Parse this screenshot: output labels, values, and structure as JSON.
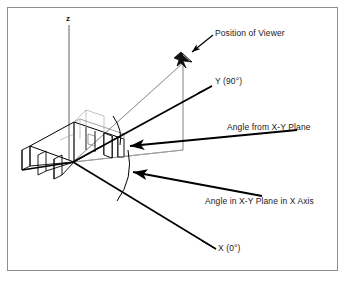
{
  "figure": {
    "type": "technical-line-diagram",
    "title_internal": "3D viewing angle / position of viewer diagram",
    "background_color": "#ffffff",
    "border_color": "#8f8f8f",
    "line_color": "#000000",
    "thin_line_color": "#8a8a8a",
    "axes": [
      {
        "name": "z-axis",
        "label": "z",
        "direction": "vertical-up"
      },
      {
        "name": "y-axis",
        "label": "Y (90°)",
        "direction": "upper-right"
      },
      {
        "name": "x-axis",
        "label": "X (0°)",
        "direction": "lower-right"
      }
    ],
    "labels": {
      "z_axis": "z",
      "position_of_viewer": "Position of Viewer",
      "y_axis": "Y (90°)",
      "angle_from_plane": "Angle from X-Y Plane",
      "angle_in_plane": "Angle in X-Y Plane in X Axis",
      "x_axis": "X (0°)"
    },
    "annotations": [
      {
        "name": "position-of-viewer",
        "text": "Position of Viewer",
        "points_to": "viewer-glyph"
      },
      {
        "name": "y-axis-label",
        "text": "Y (90°)",
        "points_to": "y-axis-line"
      },
      {
        "name": "angle-from-xy-plane",
        "text": "Angle from X-Y Plane",
        "points_to": "elevation-angle-arc"
      },
      {
        "name": "angle-in-xy-plane",
        "text": "Angle in X-Y Plane in X Axis",
        "points_to": "azimuth-angle-arc"
      },
      {
        "name": "x-axis-label",
        "text": "X (0°)",
        "points_to": "x-axis-line"
      }
    ],
    "objects": [
      {
        "name": "viewer-glyph",
        "description": "small aircraft symbol marking viewer position"
      },
      {
        "name": "wireframe-model",
        "description": "wireframe structural beam model at origin"
      },
      {
        "name": "projection-plane",
        "description": "thin vertical plane from origin to viewer"
      },
      {
        "name": "elevation-angle-arc",
        "description": "arc between X-Y plane and line of sight"
      },
      {
        "name": "azimuth-angle-arc",
        "description": "arc in X-Y plane measured from X axis"
      }
    ]
  }
}
